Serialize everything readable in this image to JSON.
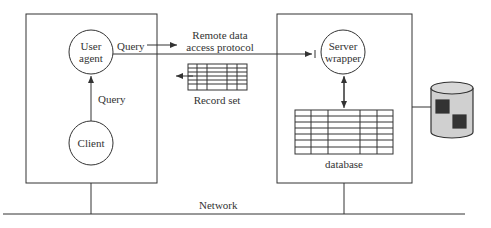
{
  "diagram": {
    "client_node": {
      "user_agent_label_1": "User",
      "user_agent_label_2": "agent",
      "client_label": "Client",
      "query_internal": "Query",
      "query_outgoing": "Query"
    },
    "protocol": {
      "line1": "Remote data",
      "line2": "access protocol",
      "record_set": "Record set"
    },
    "server_node": {
      "server_label_1": "Server",
      "server_label_2": "wrapper",
      "database_label": "database"
    },
    "network_label": "Network",
    "colors": {
      "stroke": "#333333",
      "cylinder_fill": "#d0d0d0",
      "block_fill": "#333333"
    }
  }
}
